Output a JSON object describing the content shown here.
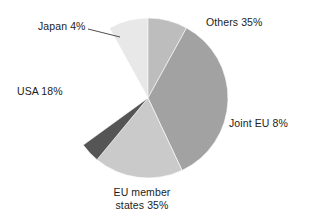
{
  "chart_data": {
    "type": "pie",
    "title": "",
    "subtitle": "",
    "xlabel": "",
    "ylabel": "",
    "legend_position": "none",
    "grid": false,
    "units": "percent",
    "start_angle_deg": 0,
    "direction": "clockwise",
    "categories": [
      "Others",
      "Joint EU",
      "EU member states",
      "USA",
      "Japan"
    ],
    "values": [
      35,
      8,
      35,
      18,
      4
    ],
    "labels": [
      "Others 35%",
      "Joint EU 8%",
      "EU member\nstates 35%",
      "USA 18%",
      "Japan 4%"
    ],
    "colors": [
      "#e8e8e8",
      "#bdbdbd",
      "#a2a2a2",
      "#cacaca",
      "#555555"
    ],
    "slices": [
      {
        "name": "Others",
        "value": 35,
        "label": "Others 35%",
        "color": "#e8e8e8",
        "start_deg": 331.2,
        "end_deg": 457.2
      },
      {
        "name": "Joint EU",
        "value": 8,
        "label": "Joint EU 8%",
        "color": "#bdbdbd",
        "start_deg": 0.0,
        "end_deg": 28.8
      },
      {
        "name": "EU member states",
        "value": 35,
        "label": "EU member states 35%",
        "color": "#a2a2a2",
        "start_deg": 28.8,
        "end_deg": 154.8
      },
      {
        "name": "USA",
        "value": 18,
        "label": "USA 18%",
        "color": "#cacaca",
        "start_deg": 154.8,
        "end_deg": 219.6
      },
      {
        "name": "Japan",
        "value": 4,
        "label": "Japan 4%",
        "color": "#555555",
        "start_deg": 219.6,
        "end_deg": 234.0
      }
    ],
    "geometry": {
      "cx": 148,
      "cy": 98,
      "r": 80
    },
    "background_color": "#ffffff",
    "text_color": "#1c1c1c"
  },
  "labels": {
    "others": "Others 35%",
    "joint_eu": "Joint EU 8%",
    "eu_members_line1": "EU member",
    "eu_members_line2": "states 35%",
    "usa": "USA 18%",
    "japan": "Japan 4%"
  }
}
